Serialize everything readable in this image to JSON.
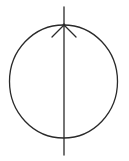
{
  "diagram": {
    "elements": [
      {
        "kind": "circle",
        "name": "outline-circle"
      },
      {
        "kind": "line",
        "name": "vertical-axis-line",
        "orientation": "vertical",
        "passes_through": "center"
      },
      {
        "kind": "arrowhead",
        "name": "arrowhead",
        "direction": "up",
        "location": "top-of-circle"
      }
    ],
    "colors": {
      "stroke": "#2a2a2a",
      "background": "#ffffff"
    }
  }
}
